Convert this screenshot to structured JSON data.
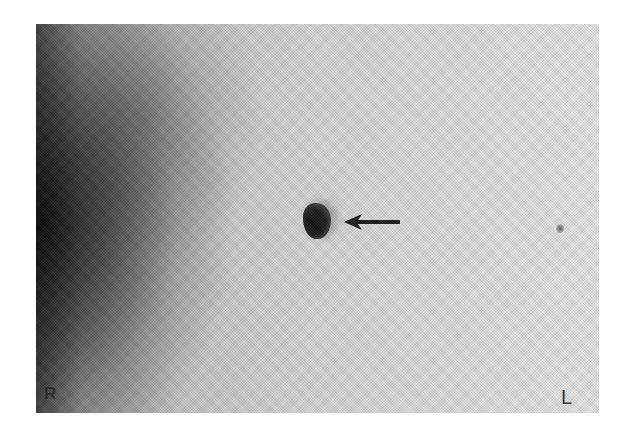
{
  "image": {
    "type": "grayscale radiograph",
    "colors": {
      "background": "#ffffff",
      "film_dark": "#1e1e1e",
      "film_light": "#e0e0e0",
      "arrow": "#1a1a1a"
    }
  },
  "markers": {
    "right": "R",
    "left": "L"
  },
  "annotations": [
    {
      "type": "arrow",
      "direction": "left",
      "points_to": "dark focal lesion"
    }
  ]
}
